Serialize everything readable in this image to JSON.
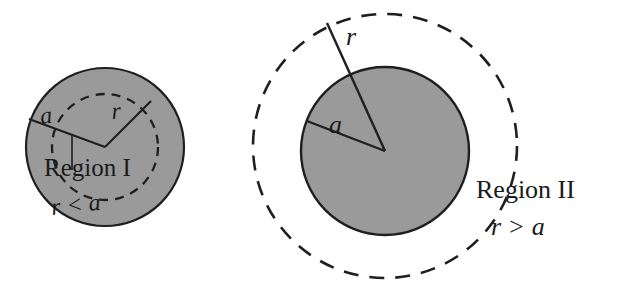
{
  "figure": {
    "background_color": "#ffffff",
    "width": 620,
    "height": 290
  },
  "style": {
    "fill_gray": "#9a9a9a",
    "stroke_dark": "#1f1f1f",
    "text_color": "#1a1a1a"
  },
  "panels": [
    {
      "id": "region-one",
      "region_label": "Region I",
      "relation_label": "r < a",
      "radius_outer_label": "a",
      "radius_inner_label": "r",
      "description": "Shaded sphere of radius a with dashed interior Gaussian surface of radius r",
      "solid_circle": {
        "cx": 105,
        "cy": 147,
        "r": 79
      },
      "dashed_circle": {
        "cx": 105,
        "cy": 147,
        "r": 53
      },
      "radius_a_line": {
        "x1": 105,
        "y1": 147,
        "x2": 29,
        "y2": 119
      },
      "radius_r_line": {
        "x1": 105,
        "y1": 147,
        "x2": 151,
        "y2": 101
      },
      "label_positions": {
        "a": {
          "x": 41,
          "y": 124
        },
        "r": {
          "x": 112,
          "y": 119
        },
        "region": {
          "x": 44,
          "y": 176
        },
        "relation": {
          "x": 52,
          "y": 215
        }
      }
    },
    {
      "id": "region-two",
      "region_label": "Region II",
      "relation_label": "r > a",
      "radius_outer_label": "r",
      "radius_inner_label": "a",
      "description": "Shaded sphere of radius a with dashed exterior Gaussian surface of radius r",
      "solid_circle": {
        "cx": 385,
        "cy": 151,
        "r": 84
      },
      "dashed_circle": {
        "cx": 385,
        "cy": 146,
        "r": 132
      },
      "radius_a_line": {
        "x1": 385,
        "y1": 151,
        "x2": 307,
        "y2": 121
      },
      "radius_r_line": {
        "x1": 385,
        "y1": 151,
        "x2": 327,
        "y2": 23
      },
      "label_positions": {
        "a": {
          "x": 329,
          "y": 133
        },
        "r": {
          "x": 346,
          "y": 45
        },
        "region": {
          "x": 476,
          "y": 198
        },
        "relation": {
          "x": 491,
          "y": 235
        }
      }
    }
  ]
}
